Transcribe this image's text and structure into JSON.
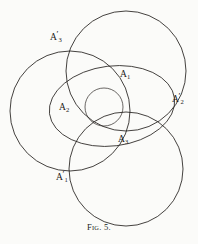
{
  "figure": {
    "caption_prefix": "F",
    "caption_smallcaps": "IG",
    "caption_suffix": ". 5.",
    "caption_full": "Fig. 5.",
    "stroke_color": "#23201d",
    "background_color": "#fbfbf9",
    "width": 198,
    "height": 244
  },
  "labels": [
    {
      "id": "A3prime",
      "base": "A",
      "sub": "3",
      "prime": "′",
      "text": "A′3",
      "x": 50,
      "y": 34
    },
    {
      "id": "A1",
      "base": "A",
      "sub": "1",
      "prime": "",
      "text": "A1",
      "x": 120,
      "y": 70
    },
    {
      "id": "A2prime",
      "base": "A",
      "sub": "2",
      "prime": "′",
      "text": "A′2",
      "x": 172,
      "y": 96
    },
    {
      "id": "A2",
      "base": "A",
      "sub": "2",
      "prime": "",
      "text": "A2",
      "x": 59,
      "y": 104
    },
    {
      "id": "A3",
      "base": "A",
      "sub": "3",
      "prime": "",
      "text": "A3",
      "x": 118,
      "y": 136
    },
    {
      "id": "A1prime",
      "base": "A",
      "sub": "1",
      "prime": "′",
      "text": "A′1",
      "x": 56,
      "y": 172
    }
  ],
  "geometry": {
    "circles": [
      {
        "name": "circle-top-right",
        "cx": 126,
        "cy": 71,
        "r": 60
      },
      {
        "name": "circle-left",
        "cx": 70,
        "cy": 111,
        "r": 60
      },
      {
        "name": "circle-bottom-right",
        "cx": 126,
        "cy": 169,
        "r": 57
      },
      {
        "name": "circle-small-center",
        "cx": 104,
        "cy": 107,
        "r": 19
      }
    ],
    "ovals": [
      {
        "name": "oval-large",
        "cx": 112,
        "cy": 106,
        "rx": 63,
        "ry": 40,
        "rotation": -7
      }
    ]
  }
}
